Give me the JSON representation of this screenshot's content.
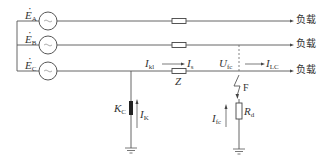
{
  "diagram": {
    "colors": {
      "line": "#555555",
      "text": "#333333",
      "arrester": "#222222"
    },
    "sources": [
      {
        "symbol": "E",
        "sub": "A",
        "y": 21
      },
      {
        "symbol": "E",
        "sub": "B",
        "y": 45
      },
      {
        "symbol": "E",
        "sub": "C",
        "y": 71
      }
    ],
    "loads": [
      "负载",
      "负载",
      "负载"
    ],
    "labels": {
      "ikl_sym": "I",
      "ikl_sub": "kl",
      "is_sym": "I",
      "is_sub": "s",
      "z": "Z",
      "ufc_sym": "U",
      "ufc_sub": "fc",
      "ilc_sym": "I",
      "ilc_sub": "LC",
      "kc_sym": "K",
      "kc_sub": "C",
      "ik_sym": "I",
      "ik_sub": "K",
      "f": "F",
      "ifc_sym": "I",
      "ifc_sub": "fc",
      "rd_sym": "R",
      "rd_sub": "d"
    }
  }
}
